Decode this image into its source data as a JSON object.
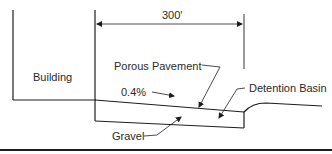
{
  "diagram": {
    "dimension": {
      "label": "300'"
    },
    "labels": {
      "building": "Building",
      "porous_pavement": "Porous Pavement",
      "detention_basin": "Detention Basin",
      "slope": "0.4%",
      "gravel": "Gravel"
    },
    "colors": {
      "line": "#1e1e1e",
      "text": "#2a2a2a",
      "background": "#ffffff"
    }
  }
}
